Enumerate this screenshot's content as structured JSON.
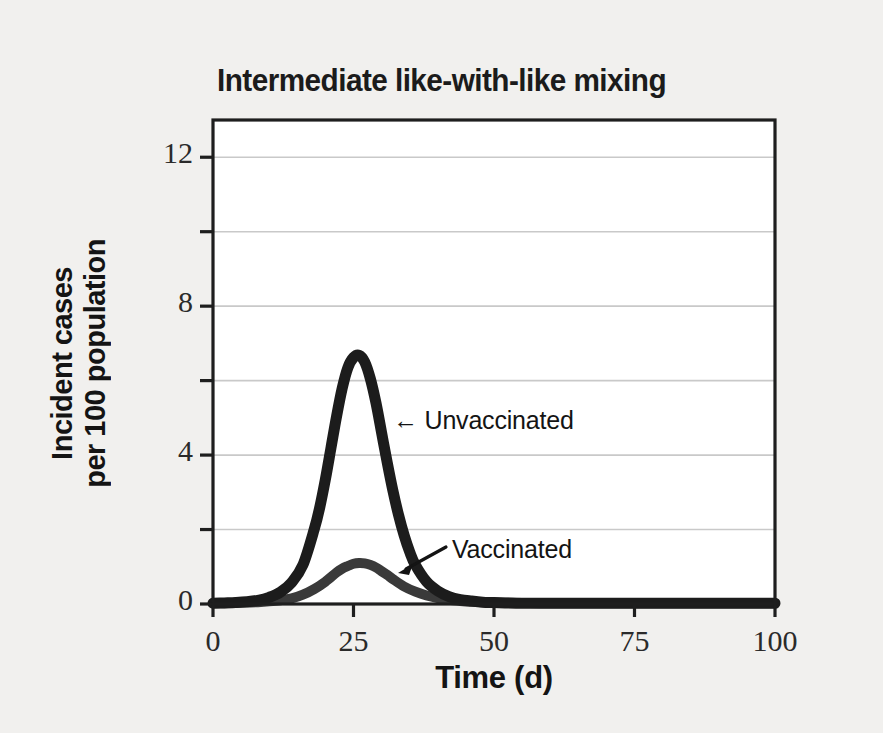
{
  "chart_data": {
    "type": "line",
    "title": "Intermediate like-with-like mixing",
    "xlabel": "Time (d)",
    "ylabel_line1": "Incident cases",
    "ylabel_line2": "per 100 population",
    "xlim": [
      0,
      100
    ],
    "ylim": [
      0,
      13
    ],
    "xticks": [
      0,
      25,
      50,
      75,
      100
    ],
    "xtick_labels": [
      "0",
      "25",
      "50",
      "75",
      "100"
    ],
    "yticks": [
      0,
      2,
      4,
      6,
      8,
      10,
      12
    ],
    "ytick_labels": [
      "0",
      "",
      "4",
      "",
      "8",
      "",
      "12"
    ],
    "grid": "horizontal",
    "gridlines_at": [
      2,
      4,
      6,
      8,
      10,
      12
    ],
    "legend_position": "inline-annotations",
    "annotations": [
      {
        "text": "← Unvaccinated",
        "series": "Unvaccinated",
        "x_px": 399,
        "y_px": 422,
        "arrow": "left-arrow-glyph"
      },
      {
        "text": "Vaccinated",
        "series": "Vaccinated",
        "x_px": 452,
        "y_px": 551,
        "arrow": "diagonal-down-left"
      }
    ],
    "series": [
      {
        "name": "Unvaccinated",
        "color": "#1c1c1c",
        "linewidth": 11,
        "x": [
          0,
          2,
          4,
          6,
          8,
          10,
          12,
          14,
          16,
          18,
          19,
          20,
          21,
          22,
          23,
          24,
          25,
          26,
          27,
          28,
          29,
          30,
          31,
          32,
          33,
          34,
          35,
          36,
          38,
          40,
          42,
          44,
          46,
          48,
          50,
          55,
          60,
          70,
          80,
          90,
          100
        ],
        "y": [
          0.02,
          0.03,
          0.04,
          0.06,
          0.1,
          0.18,
          0.32,
          0.58,
          1.05,
          2.0,
          2.6,
          3.35,
          4.2,
          5.05,
          5.8,
          6.35,
          6.62,
          6.68,
          6.5,
          6.05,
          5.4,
          4.6,
          3.8,
          3.05,
          2.4,
          1.85,
          1.4,
          1.05,
          0.6,
          0.35,
          0.2,
          0.12,
          0.08,
          0.05,
          0.04,
          0.02,
          0.02,
          0.02,
          0.02,
          0.02,
          0.02
        ]
      },
      {
        "name": "Vaccinated",
        "color": "#3a3a3a",
        "linewidth": 10,
        "x": [
          0,
          2,
          4,
          6,
          8,
          10,
          12,
          14,
          16,
          18,
          20,
          22,
          23,
          24,
          25,
          26,
          27,
          28,
          29,
          30,
          31,
          32,
          34,
          36,
          38,
          40,
          42,
          44,
          46,
          48,
          50,
          55,
          60,
          70,
          80,
          90,
          100
        ],
        "y": [
          0.02,
          0.02,
          0.03,
          0.04,
          0.05,
          0.07,
          0.1,
          0.15,
          0.25,
          0.4,
          0.6,
          0.85,
          0.95,
          1.02,
          1.08,
          1.1,
          1.09,
          1.05,
          0.98,
          0.88,
          0.78,
          0.67,
          0.47,
          0.33,
          0.23,
          0.16,
          0.11,
          0.08,
          0.06,
          0.05,
          0.04,
          0.03,
          0.02,
          0.02,
          0.02,
          0.02,
          0.02
        ]
      }
    ],
    "colors": {
      "background": "#f1f0ee",
      "plot_background": "#ffffff",
      "axis": "#1e1e1e",
      "grid": "#c9c9c9",
      "text": "#151515"
    }
  }
}
